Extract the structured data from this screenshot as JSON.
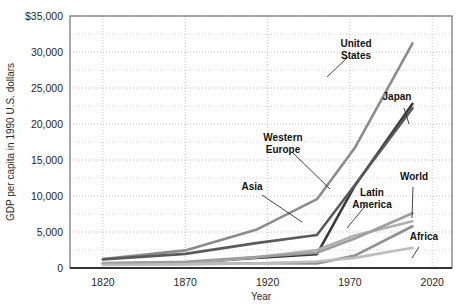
{
  "chart_data": {
    "type": "line",
    "title": "",
    "xlabel": "Year",
    "ylabel": "GDP per capita in 1990 U.S. dollars",
    "xlim": [
      1800,
      2032
    ],
    "ylim": [
      0,
      35000
    ],
    "xticks": [
      1820,
      1870,
      1920,
      1970,
      2020
    ],
    "xtick_labels": [
      "1820",
      "1870",
      "1920",
      "1970",
      "2020"
    ],
    "yticks": [
      0,
      5000,
      10000,
      15000,
      20000,
      25000,
      30000,
      35000
    ],
    "ytick_labels": [
      "0",
      "5,000",
      "10,000",
      "15,000",
      "20,000",
      "25,000",
      "30,000",
      "$35,000"
    ],
    "grid": true,
    "grid_style": "dotted",
    "minor_gridlines_y": [
      2500,
      7500,
      12500,
      17500,
      22500,
      27500,
      32500
    ],
    "legend": "inline-annotations",
    "x": [
      1820,
      1870,
      1913,
      1950,
      1973,
      2008
    ],
    "series": [
      {
        "name": "United States",
        "color": "#8c8c8c",
        "values": [
          1257,
          2445,
          5301,
          9561,
          16689,
          31200
        ]
      },
      {
        "name": "Japan",
        "color": "#3b3b3b",
        "values": [
          669,
          737,
          1387,
          1921,
          11434,
          22800
        ]
      },
      {
        "name": "Western Europe",
        "color": "#5a5a5a",
        "values": [
          1202,
          1960,
          3458,
          4579,
          11534,
          22200
        ]
      },
      {
        "name": "Asia",
        "color": "#909090",
        "values": [
          577,
          550,
          658,
          634,
          1718,
          5800
        ]
      },
      {
        "name": "Latin America",
        "color": "#b0b0b0",
        "values": [
          692,
          681,
          1481,
          2506,
          4504,
          6500
        ]
      },
      {
        "name": "World",
        "color": "#9e9e9e",
        "values": [
          667,
          870,
          1524,
          2111,
          4091,
          7600
        ]
      },
      {
        "name": "Africa",
        "color": "#bdbdbd",
        "values": [
          420,
          500,
          637,
          894,
          1410,
          2800
        ]
      }
    ],
    "annotations": [
      {
        "label": "United States",
        "lines": [
          "United",
          "States"
        ],
        "x": 356,
        "y": 47
      },
      {
        "label": "Japan",
        "lines": [
          "Japan"
        ],
        "x": 397,
        "y": 100
      },
      {
        "label": "Western Europe",
        "lines": [
          "Western",
          "Europe"
        ],
        "x": 283,
        "y": 141
      },
      {
        "label": "Asia",
        "lines": [
          "Asia"
        ],
        "x": 252,
        "y": 190
      },
      {
        "label": "Latin America",
        "lines": [
          "Latin",
          "America"
        ],
        "x": 372,
        "y": 196
      },
      {
        "label": "World",
        "lines": [
          "World"
        ],
        "x": 414,
        "y": 180
      },
      {
        "label": "Africa",
        "lines": [
          "Africa"
        ],
        "x": 424,
        "y": 240
      }
    ]
  }
}
